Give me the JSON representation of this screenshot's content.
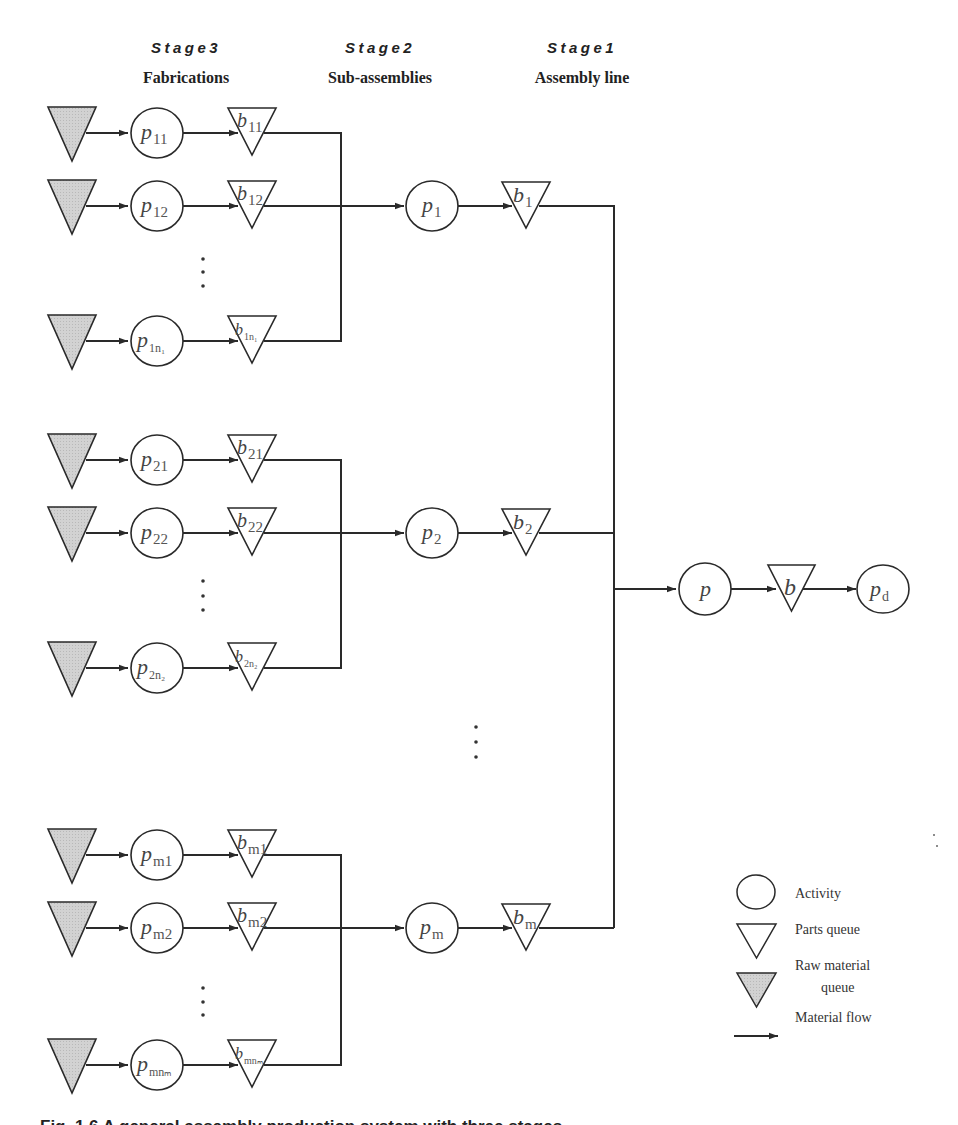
{
  "headers": [
    {
      "stage": "Stage3",
      "title": "Fabrications",
      "x": 186
    },
    {
      "stage": "Stage2",
      "title": "Sub-assemblies",
      "x": 380
    },
    {
      "stage": "Stage1",
      "title": "Assembly line",
      "x": 582
    }
  ],
  "groups": [
    {
      "rows": [
        {
          "y": 133,
          "p": "p",
          "p_sub": "11",
          "b": "b",
          "b_sub": "11"
        },
        {
          "y": 206,
          "p": "p",
          "p_sub": "12",
          "b": "b",
          "b_sub": "12"
        },
        {
          "y": 341,
          "p": "p",
          "p_sub": "1n₁",
          "b": "b",
          "b_sub": "1n₁"
        }
      ],
      "dots_y": [
        259,
        272,
        286
      ],
      "sub_assembly": {
        "y": 206,
        "p": "p",
        "p_sub": "1",
        "b": "b",
        "b_sub": "1"
      }
    },
    {
      "rows": [
        {
          "y": 460,
          "p": "p",
          "p_sub": "21",
          "b": "b",
          "b_sub": "21"
        },
        {
          "y": 533,
          "p": "p",
          "p_sub": "22",
          "b": "b",
          "b_sub": "22"
        },
        {
          "y": 668,
          "p": "p",
          "p_sub": "2n₂",
          "b": "b",
          "b_sub": "2n₂"
        }
      ],
      "dots_y": [
        581,
        596,
        610
      ],
      "sub_assembly": {
        "y": 533,
        "p": "p",
        "p_sub": "2",
        "b": "b",
        "b_sub": "2"
      }
    },
    {
      "rows": [
        {
          "y": 855,
          "p": "p",
          "p_sub": "m1",
          "b": "b",
          "b_sub": "m1"
        },
        {
          "y": 928,
          "p": "p",
          "p_sub": "m2",
          "b": "b",
          "b_sub": "m2"
        },
        {
          "y": 1065,
          "p": "p",
          "p_sub": "mnₘ",
          "b": "b",
          "b_sub": "mnₘ"
        }
      ],
      "dots_y": [
        988,
        1002,
        1015
      ],
      "sub_assembly": {
        "y": 928,
        "p": "p",
        "p_sub": "m",
        "b": "b",
        "b_sub": "m"
      }
    }
  ],
  "between_groups_dots_y": [
    727,
    742,
    757
  ],
  "final_line": {
    "y": 589,
    "p": "p",
    "b": "b",
    "pd": "p",
    "pd_sub": "d"
  },
  "legend": {
    "activity": "Activity",
    "parts_queue": "Parts queue",
    "raw_material_line1": "Raw material",
    "raw_material_line2": "queue",
    "material_flow": "Material flow"
  },
  "caption": "Fig. 1.6  A general assembly production system with three stages",
  "colors": {
    "stroke": "#2a2a2a",
    "raw_fill": "#cfcfcf",
    "text": "#333333"
  }
}
